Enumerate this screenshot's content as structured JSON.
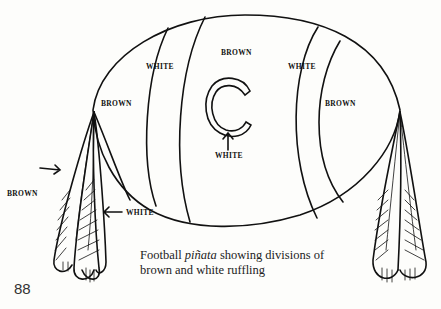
{
  "labels": {
    "top_center": "BROWN",
    "white_left": "WHITE",
    "white_right": "WHITE",
    "brown_left": "BROWN",
    "brown_right": "BROWN",
    "c_white": "WHITE",
    "tassel_brown": "BROWN",
    "tassel_white": "WHITE"
  },
  "emblem": {
    "letter": "C"
  },
  "caption": {
    "prefix": "Football ",
    "italic": "piñata",
    "suffix": " showing divisions of brown and white ruffling"
  },
  "page_number": "88",
  "colors": {
    "ink": "#111111",
    "paper": "#fdfdfb"
  }
}
